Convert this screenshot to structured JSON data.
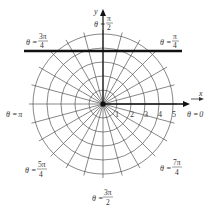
{
  "diagram": {
    "type": "polar-grid",
    "center": [
      103,
      104
    ],
    "ring_spacing_px": 14,
    "ring_count": 5,
    "radial_line_step": "pi/12",
    "colors": {
      "grid": "#555555",
      "axis": "#111111",
      "highlight_line": "#111111",
      "text": "#333333"
    },
    "axes": {
      "x_label": "x",
      "y_label": "y"
    },
    "tick_labels": [
      "1",
      "2",
      "3",
      "4",
      "5"
    ],
    "angle_labels": {
      "theta_0": "θ = 0",
      "theta_pi_over_4": "θ = π/4",
      "theta_pi_over_2": "θ = π/2",
      "theta_3pi_over_4": "θ = 3π/4",
      "theta_pi": "θ = π",
      "theta_5pi_over_4": "θ = 5π/4",
      "theta_3pi_over_2": "θ = 3π/2",
      "theta_7pi_over_4": "θ = 7π/4"
    },
    "label_parts": {
      "theta_eq": "θ =",
      "zero": "0",
      "pi": "π",
      "pi_num": "π",
      "three_pi_num": "3π",
      "five_pi_num": "5π",
      "seven_pi_num": "7π",
      "denom_2": "2",
      "denom_4": "4"
    },
    "highlight_line": {
      "description": "horizontal line y = constant",
      "y_px": 51,
      "x_start_px": 24,
      "x_end_px": 182
    }
  }
}
